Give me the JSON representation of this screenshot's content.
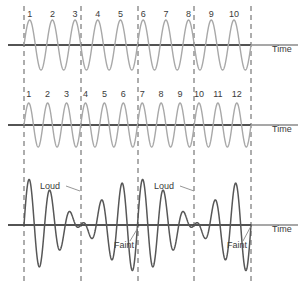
{
  "figure": {
    "width": 306,
    "height": 287,
    "background": "#ffffff"
  },
  "colors": {
    "wave_light": "#a8a8a8",
    "wave_dark": "#575757",
    "axis_dark": "#1a1a1a",
    "axis_gray": "#8a8a8a",
    "dashed_line": "#6b6b6b",
    "text": "#3a3a3a",
    "leader_line": "#8a8a8a"
  },
  "dashed_lines": {
    "count": 5,
    "x_positions": [
      24,
      81,
      138,
      194,
      251
    ],
    "y_top": 6,
    "y_bottom": 281,
    "dash_pattern": "5,4"
  },
  "panels": [
    {
      "id": "wave-top",
      "name": "first-source-wave",
      "baseline_y": 45,
      "amplitude": 25,
      "cycles": 10,
      "stroke": "#a8a8a8",
      "stroke_width": 1.4,
      "time_label": "Time",
      "time_label_x": 272,
      "time_label_y": 52,
      "axis_x_start": 8,
      "axis_x_end": 298,
      "axis_dark_end": 251,
      "peak_labels": [
        "1",
        "2",
        "3",
        "4",
        "5",
        "6",
        "7",
        "8",
        "9",
        "10"
      ],
      "peak_label_y": 17
    },
    {
      "id": "wave-middle",
      "name": "second-source-wave",
      "baseline_y": 125,
      "amplitude": 22,
      "cycles": 12,
      "stroke": "#a8a8a8",
      "stroke_width": 1.4,
      "time_label": "Time",
      "time_label_x": 272,
      "time_label_y": 132,
      "axis_x_start": 8,
      "axis_x_end": 298,
      "axis_dark_end": 251,
      "peak_labels": [
        "1",
        "2",
        "3",
        "4",
        "5",
        "6",
        "7",
        "8",
        "9",
        "10",
        "11",
        "12"
      ],
      "peak_label_y": 97
    },
    {
      "id": "wave-bottom",
      "name": "resultant-beat-wave",
      "baseline_y": 225,
      "amplitude": 46,
      "cycles_a": 10,
      "cycles_b": 12,
      "stroke": "#575757",
      "stroke_width": 1.5,
      "time_label": "Time",
      "time_label_x": 272,
      "time_label_y": 232,
      "axis_x_start": 8,
      "axis_x_end": 298,
      "axis_dark_end": 251
    }
  ],
  "annotations": [
    {
      "name": "loud-label-1",
      "text": "Loud",
      "x": 50,
      "y": 189,
      "leader": {
        "x1": 66,
        "y1": 186,
        "x2": 80,
        "y2": 191
      }
    },
    {
      "name": "faint-label-1",
      "text": "Faint",
      "x": 124,
      "y": 248,
      "leader": {
        "x1": 130,
        "y1": 241,
        "x2": 139,
        "y2": 226
      }
    },
    {
      "name": "loud-label-2",
      "text": "Loud",
      "x": 164,
      "y": 189,
      "leader": {
        "x1": 180,
        "y1": 186,
        "x2": 194,
        "y2": 191
      }
    },
    {
      "name": "faint-label-2",
      "text": "Faint",
      "x": 237,
      "y": 248,
      "leader": {
        "x1": 243,
        "y1": 241,
        "x2": 251,
        "y2": 226
      }
    }
  ],
  "chart_data": {
    "type": "line",
    "xlabel": "Time",
    "ylabel": "",
    "grid": false,
    "legend": "none",
    "x_domain": [
      24,
      251
    ],
    "series": [
      {
        "name": "Wave 1 (10 cycles)",
        "type": "sine",
        "cycles": 10,
        "amplitude": 25,
        "baseline_y": 45,
        "peak_labels": [
          "1",
          "2",
          "3",
          "4",
          "5",
          "6",
          "7",
          "8",
          "9",
          "10"
        ]
      },
      {
        "name": "Wave 2 (12 cycles)",
        "type": "sine",
        "cycles": 12,
        "amplitude": 22,
        "baseline_y": 125,
        "peak_labels": [
          "1",
          "2",
          "3",
          "4",
          "5",
          "6",
          "7",
          "8",
          "9",
          "10",
          "11",
          "12"
        ]
      },
      {
        "name": "Resultant (beats)",
        "type": "sum-of-sines",
        "cycles": [
          10,
          12
        ],
        "amplitude": 46,
        "baseline_y": 225,
        "beats": 2,
        "annotations": [
          "Loud",
          "Faint",
          "Loud",
          "Faint"
        ]
      }
    ],
    "markers": {
      "name": "beat-boundary-dashed-lines",
      "x_positions": [
        24,
        81,
        138,
        194,
        251
      ]
    }
  }
}
